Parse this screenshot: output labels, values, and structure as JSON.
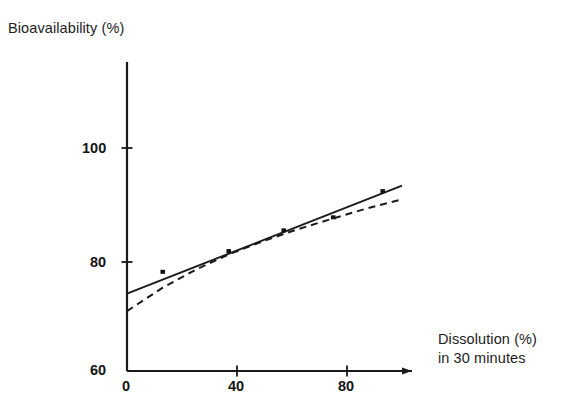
{
  "chart_data": {
    "type": "scatter",
    "title": "",
    "ylabel": "Bioavailability (%)",
    "xlabel_line1": "Dissolution (%)",
    "xlabel_line2": "in 30 minutes",
    "xlabel": "Dissolution (%) in 30 minutes",
    "grid": false,
    "legend": "none",
    "xlim": [
      0,
      104
    ],
    "ylim": [
      60,
      115
    ],
    "xticks": [
      0,
      40,
      80
    ],
    "xtick_labels": [
      "0",
      "40",
      "80"
    ],
    "yticks": [
      60,
      80,
      100
    ],
    "ytick_labels": [
      "60",
      "80",
      "100"
    ],
    "points": {
      "x": [
        13,
        37,
        57,
        75,
        93
      ],
      "y": [
        78.2,
        82.0,
        85.8,
        88.2,
        93.0
      ]
    },
    "series": [
      {
        "name": "linear regression",
        "style": "solid",
        "x": [
          0,
          100
        ],
        "y": [
          74.2,
          94.0
        ]
      },
      {
        "name": "curvilinear fit",
        "style": "dashed",
        "x": [
          0,
          13,
          25,
          37,
          50,
          62,
          75,
          87,
          100
        ],
        "y": [
          71.0,
          75.3,
          78.6,
          81.4,
          83.9,
          86.0,
          88.0,
          89.8,
          91.5
        ]
      }
    ],
    "colors": {
      "axis": "#1a1a1a",
      "solid_line": "#1a1a1a",
      "dashed_line": "#1a1a1a",
      "point": "#111111",
      "background": "#ffffff"
    }
  }
}
